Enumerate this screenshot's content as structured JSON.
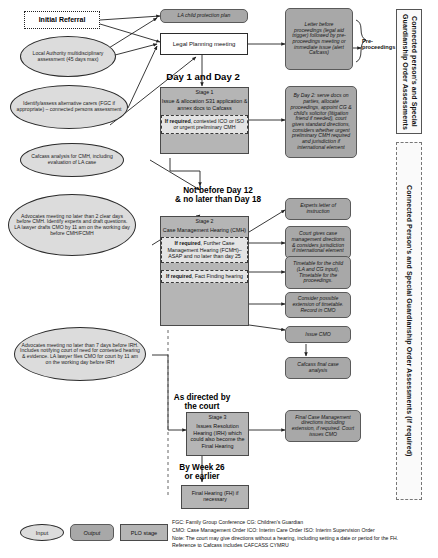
{
  "nodes": {
    "initial_referral": "Initial Referral",
    "la_assessment": "Local Authority multidisciplinary assessment (45 days max)",
    "identify_carers": "Identify/assess alternative carers (FGC if appropriate) – connected persons assessment",
    "cafcass_analysis": "Cafcass analysis for CMH, including evaluation of LA case",
    "advocates_cmh": "Advocates meeting no later than 2 clear days before CMH. Identify experts and draft questions. LA lawyer drafts CMO by 11 am on the working day before CMH/FCMH",
    "advocates_irh": "Advocates meeting no later than 7 days before IRH. Includes notifying court of need for contested hearing & evidence. LA lawyer files CMO for court by 11 am on the working day before IRH",
    "la_child_protection_plan": "LA child protection plan",
    "legal_planning_meeting": "Legal Planning meeting",
    "letter_before_proceedings": "Letter before proceedings (legal aid trigger) followed by pre-proceedings meeting or immediate issue (alert Cafcass)",
    "by_day_2": "By Day 2: serve docs on parties, allocate proceedings, appoint CG & child's solicitor (litigation friend if needed), court gives standard directions, considers whether urgent preliminary CMH required and jurisdiction if international element",
    "experts_letter": "Experts letter of instruction",
    "court_case_mgmt_directions": "Court gives case management directions & considers jurisdiction if international element",
    "timetable_for_child": "Timetable for the child (LA and CG input), Timetable for the proceedings.",
    "consider_extension": "Consider possible extension of timetable. Record in CMO",
    "issue_cmo": "Issue CMO",
    "cafcass_final_analysis": "Cafcass final case analysis",
    "final_case_mgmt_directions": "Final Case Management directions including extension, if required. Court issues CMO",
    "final_hearing": "Final Hearing (FH) if necessary"
  },
  "stage1": {
    "header": "Stage 1",
    "body": "Issue & allocation S31 application & annex docs to Cafcass",
    "if_required_label": "If required",
    "if_required_text": ", contested ICO or ISO or urgent preliminary CMH"
  },
  "stage2": {
    "header": "Stage 2",
    "body": "Case Management Hearing (CMH)",
    "fcmh_label": "If required",
    "fcmh_text": ", Further Case Management Hearing (FCMH)– ASAP and no later than day 25",
    "ff_label": "If required",
    "ff_text": ", Fact Finding hearing"
  },
  "stage3": {
    "header": "Stage 3",
    "body": "Issues Resolution Hearing (IRH) which could also become the Final Hearing"
  },
  "day_labels": {
    "day1_2": "Day 1 and Day 2",
    "not_before_12": "Not before Day 12\n& no later than Day 18",
    "not_before_12_line1": "Not before Day 12",
    "not_before_12_line2": "& no later than Day 18",
    "as_directed_line1": "As directed by",
    "as_directed_line2": "the court",
    "week26_line1": "By Week 26",
    "week26_line2": "or earlier"
  },
  "brackets": {
    "pre_proceedings_line1": "Pre-",
    "pre_proceedings_line2": "proceedings"
  },
  "side_panels": {
    "top": "Connected person's and Special Guardianship Order Assessments",
    "bottom": "Connected Person's and Special Guardianship Order Assessments (if required)"
  },
  "legend": {
    "input": "Input",
    "output": "Output",
    "plo_stage": "PLO stage",
    "lines": [
      "FGC: Family Group Conference     CG: Children's Guardian",
      "CMO: Case Management Order     ICO: Interim Care Order     ISO: Interim Supervision Order",
      "Note: The court may give directions without a hearing, including setting a date or period for the FH.",
      "Reference to Cafcass includes CAFCASS CYMRU"
    ],
    "line1": "FGC: Family Group Conference     CG: Children's Guardian",
    "line2": "CMO: Case Management Order     ICO: Interim Care Order     ISO: Interim Supervision Order",
    "line3": "Note: The court may give directions without a hearing, including setting a date or period for the FH.",
    "line4": "Reference to Cafcass includes CAFCASS CYMRU"
  },
  "colors": {
    "input_fill": "#dcdcdc",
    "output_fill": "#a8a8a8",
    "stage_fill": "#b5b5b5",
    "if_required_fill": "#e4e4e4",
    "line": "#222222"
  }
}
